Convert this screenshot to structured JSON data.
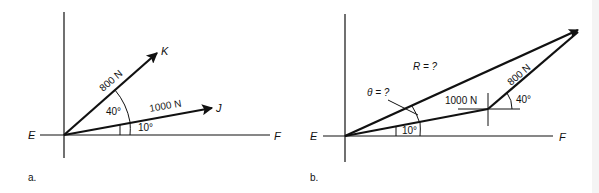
{
  "figure": {
    "panel_a": {
      "label": "a.",
      "points": {
        "origin": "E",
        "axis_end": "F",
        "vector_k_end": "K",
        "vector_j_end": "J"
      },
      "vectors": [
        {
          "name": "K",
          "magnitude_label": "800 N",
          "angle_from_j": "40°"
        },
        {
          "name": "J",
          "magnitude_label": "1000 N",
          "angle_from_ef": "10°"
        }
      ],
      "angles": {
        "between_k_and_j": "40°",
        "between_j_and_ef": "10°"
      }
    },
    "panel_b": {
      "label": "b.",
      "points": {
        "origin": "E",
        "axis_end": "F"
      },
      "vectors": [
        {
          "name": "first",
          "magnitude_label": "1000 N",
          "angle_label": "10°"
        },
        {
          "name": "second",
          "magnitude_label": "800 N",
          "angle_label": "40°"
        }
      ],
      "resultant_label": "R = ?",
      "theta_label": "θ = ?",
      "angle_first": "10°",
      "angle_second": "40°"
    }
  }
}
